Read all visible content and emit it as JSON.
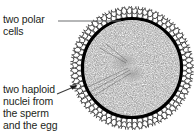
{
  "figure": {
    "background_color": "#ffffff",
    "text_color": "#231f20",
    "membrane_color": "#000000",
    "leader_line_color": "#6d6e71",
    "labels": {
      "polar_cells": "two polar\ncells",
      "haploid_nuclei": "two haploid\nnuclei from\nthe sperm\nand the egg"
    },
    "parts": {
      "corona_ring": "ring of small granulosa cells",
      "membrane": "thick black cell membrane",
      "cytoplasm": "stippled cytoplasm",
      "nuclei": "two haploid nuclei at center"
    },
    "geometry": {
      "center_x": 132,
      "center_y": 68,
      "outer_radius": 62,
      "membrane_radius": 50,
      "cytoplasm_radius": 48
    }
  }
}
